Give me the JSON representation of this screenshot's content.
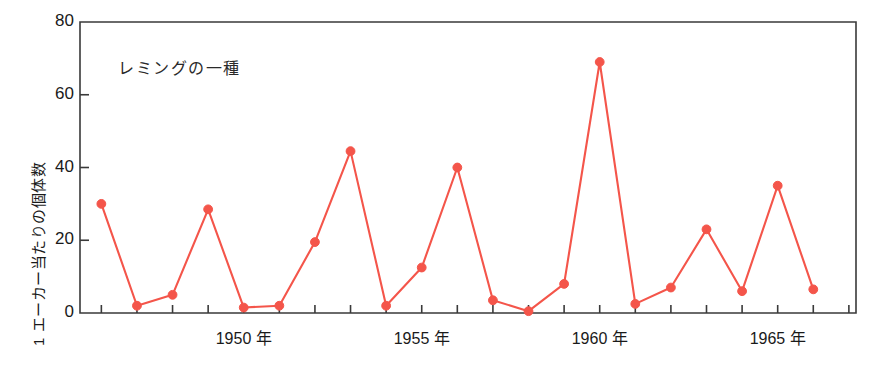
{
  "chart_data": {
    "type": "line",
    "title": "レミングの一種",
    "xlabel": "",
    "ylabel": "1 エーカー当たりの個体数",
    "ylim": [
      0,
      80
    ],
    "yticks": [
      0,
      20,
      40,
      60,
      80
    ],
    "ytick_labels": [
      "0",
      "20",
      "40",
      "60",
      "80"
    ],
    "xlim": [
      1945.4,
      1967.2
    ],
    "xtick_years": [
      1946,
      1947,
      1948,
      1949,
      1950,
      1951,
      1952,
      1953,
      1954,
      1955,
      1956,
      1957,
      1958,
      1959,
      1960,
      1961,
      1962,
      1963,
      1964,
      1965,
      1966,
      1967
    ],
    "xtick_labels": [
      {
        "year": 1950,
        "label": "1950 年"
      },
      {
        "year": 1955,
        "label": "1955 年"
      },
      {
        "year": 1960,
        "label": "1960 年"
      },
      {
        "year": 1965,
        "label": "1965 年"
      }
    ],
    "grid": false,
    "legend": "none",
    "series": [
      {
        "name": "レミングの一種",
        "color": "#f4554a",
        "marker": "circle",
        "x": [
          1946,
          1947,
          1948,
          1949,
          1950,
          1951,
          1952,
          1953,
          1954,
          1955,
          1956,
          1957,
          1958,
          1959,
          1960,
          1961,
          1962,
          1963,
          1964,
          1965,
          1966
        ],
        "values": [
          30,
          2,
          5,
          28.5,
          1.5,
          2,
          19.5,
          44.5,
          2,
          12.5,
          40,
          3.5,
          0.5,
          8,
          69,
          2.5,
          7,
          23,
          6,
          35,
          6.5
        ]
      }
    ]
  },
  "axes": {
    "frame_color": "#3a3a3a",
    "tick_color": "#3a3a3a"
  }
}
